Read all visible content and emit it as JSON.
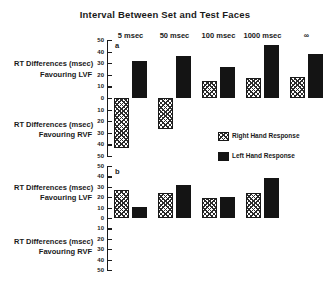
{
  "figure": {
    "title": "Interval Between Set and Test Faces"
  },
  "legend": {
    "items": [
      {
        "label": "Right Hand Response",
        "key": "right",
        "color": "#ffffff",
        "pattern": "cross-hatch"
      },
      {
        "label": "Left Hand Response",
        "key": "left",
        "color": "#141414",
        "pattern": "solid"
      }
    ]
  },
  "axis_captions": {
    "upper": {
      "line1": "RT Differences (msec)",
      "line2": "Favouring LVF"
    },
    "lower": {
      "line1": "RT Differences (msec)",
      "line2": "Favouring RVF"
    }
  },
  "panels": [
    {
      "letter": "a"
    },
    {
      "letter": "b"
    }
  ],
  "axis_ticks": [
    "50",
    "40",
    "30",
    "20",
    "10",
    "0",
    "10",
    "20",
    "30",
    "40",
    "50"
  ],
  "chart_data": [
    {
      "type": "bar",
      "panel": "a",
      "title": "Interval Between Set and Test Faces",
      "xlabel": "Interval Between Set and Test Faces",
      "ylabel": "RT Differences (msec) Favouring LVF / Favouring RVF",
      "ylim": [
        -50,
        50
      ],
      "ytick_values": [
        50,
        40,
        30,
        20,
        10,
        0,
        -10,
        -20,
        -30,
        -40,
        -50
      ],
      "ytick_labels": [
        "50",
        "40",
        "30",
        "20",
        "10",
        "0",
        "10",
        "20",
        "30",
        "40",
        "50"
      ],
      "grid": false,
      "legend_position": "center-right",
      "categories": [
        "5 msec",
        "50 msec",
        "100 msec",
        "1000 msec",
        "∞"
      ],
      "series": [
        {
          "name": "Right Hand Response",
          "values": [
            -43,
            -27,
            15,
            17,
            18
          ]
        },
        {
          "name": "Left Hand Response",
          "values": [
            32,
            36,
            27,
            46,
            38
          ]
        }
      ]
    },
    {
      "type": "bar",
      "panel": "b",
      "xlabel": "Interval Between Set and Test Faces",
      "ylabel": "RT Differences (msec) Favouring LVF / Favouring RVF",
      "ylim": [
        -50,
        50
      ],
      "ytick_values": [
        50,
        40,
        30,
        20,
        10,
        0,
        -10,
        -20,
        -30,
        -40,
        -50
      ],
      "ytick_labels": [
        "50",
        "40",
        "30",
        "20",
        "10",
        "0",
        "10",
        "20",
        "30",
        "40",
        "50"
      ],
      "grid": false,
      "categories": [
        "5 msec",
        "50 msec",
        "100 msec",
        "1000 msec"
      ],
      "series": [
        {
          "name": "Right Hand Response",
          "values": [
            27,
            24,
            19,
            24
          ]
        },
        {
          "name": "Left Hand Response",
          "values": [
            11,
            32,
            20,
            38
          ]
        }
      ]
    }
  ]
}
